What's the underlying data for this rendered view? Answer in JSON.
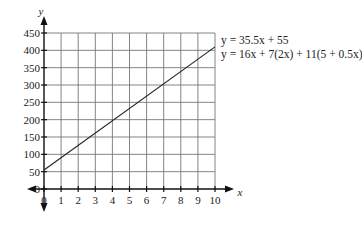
{
  "chart_data": {
    "type": "line",
    "title": "",
    "xlabel": "x",
    "ylabel": "y",
    "xlim": [
      0,
      10
    ],
    "ylim": [
      0,
      450
    ],
    "x_ticks": [
      0,
      1,
      2,
      3,
      4,
      5,
      6,
      7,
      8,
      9,
      10
    ],
    "y_ticks": [
      0,
      50,
      100,
      150,
      200,
      250,
      300,
      350,
      400,
      450
    ],
    "grid": true,
    "series": [
      {
        "name": "y = 35.5x + 55",
        "x": [
          0,
          10
        ],
        "values": [
          55,
          410
        ]
      }
    ],
    "annotations": [
      "y = 35.5x + 55",
      "y = 16x + 7(2x) + 11(5 + 0.5x)"
    ],
    "legend_position": "upper right, outside plot"
  },
  "labels": {
    "x_axis": "x",
    "y_axis": "y",
    "equation_1": "y = 35.5x + 55",
    "equation_2": "y = 16x + 7(2x) + 11(5 + 0.5x)"
  }
}
